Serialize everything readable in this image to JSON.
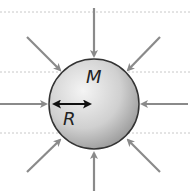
{
  "diagram": {
    "sphere": {
      "label_mass": "M",
      "label_radius": "R",
      "cx": 94,
      "cy": 104,
      "r": 45
    },
    "colors": {
      "arrow": "#8a8a8a",
      "sphere_edge": "#333333",
      "sphere_light": "#f2f2f2",
      "sphere_dark": "#9a9a9a",
      "guide": "#c8c8c8"
    },
    "guides_y": [
      12,
      72,
      133
    ],
    "arrows": [
      {
        "dir": "from-top",
        "x1": 94,
        "y1": 8,
        "x2": 94,
        "y2": 56
      },
      {
        "dir": "from-bottom",
        "x1": 94,
        "y1": 191,
        "x2": 94,
        "y2": 153
      },
      {
        "dir": "from-left",
        "x1": 0,
        "y1": 104,
        "x2": 46,
        "y2": 104
      },
      {
        "dir": "from-right",
        "x1": 188,
        "y1": 104,
        "x2": 142,
        "y2": 104
      },
      {
        "dir": "from-top-left",
        "x1": 27,
        "y1": 37,
        "x2": 60,
        "y2": 70
      },
      {
        "dir": "from-top-right",
        "x1": 160,
        "y1": 37,
        "x2": 128,
        "y2": 70
      },
      {
        "dir": "from-bottom-left",
        "x1": 27,
        "y1": 172,
        "x2": 60,
        "y2": 140
      },
      {
        "dir": "from-bottom-right",
        "x1": 160,
        "y1": 172,
        "x2": 128,
        "y2": 140
      }
    ]
  }
}
